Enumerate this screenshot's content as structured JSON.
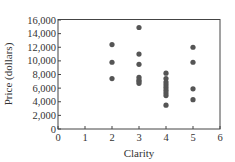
{
  "chart_data": {
    "type": "scatter",
    "title": "",
    "xlabel": "Clarity",
    "ylabel": "Price (dollars)",
    "xlim": [
      0,
      6
    ],
    "ylim": [
      0,
      16000
    ],
    "x_ticks": [
      0,
      1,
      2,
      3,
      4,
      5,
      6
    ],
    "x_tick_labels": [
      "0",
      "1",
      "2",
      "3",
      "4",
      "5",
      "6"
    ],
    "y_ticks": [
      0,
      2000,
      4000,
      6000,
      8000,
      10000,
      12000,
      14000,
      16000
    ],
    "y_tick_labels": [
      "0",
      "2,000",
      "4,000",
      "6,000",
      "8,000",
      "10,000",
      "12,000",
      "14,000",
      "16,000"
    ],
    "grid": false,
    "legend": null,
    "marker_color": "#555555",
    "series": [
      {
        "name": "Diamonds",
        "points": [
          {
            "x": 2,
            "y": 12400
          },
          {
            "x": 2,
            "y": 9800
          },
          {
            "x": 2,
            "y": 7400
          },
          {
            "x": 3,
            "y": 14900
          },
          {
            "x": 3,
            "y": 11000
          },
          {
            "x": 3,
            "y": 9500
          },
          {
            "x": 3,
            "y": 7600
          },
          {
            "x": 3,
            "y": 7200
          },
          {
            "x": 3,
            "y": 7000
          },
          {
            "x": 3,
            "y": 6700
          },
          {
            "x": 4,
            "y": 8200
          },
          {
            "x": 4,
            "y": 7400
          },
          {
            "x": 4,
            "y": 6900
          },
          {
            "x": 4,
            "y": 6500
          },
          {
            "x": 4,
            "y": 6100
          },
          {
            "x": 4,
            "y": 5700
          },
          {
            "x": 4,
            "y": 5300
          },
          {
            "x": 4,
            "y": 4900
          },
          {
            "x": 4,
            "y": 3500
          },
          {
            "x": 5,
            "y": 12000
          },
          {
            "x": 5,
            "y": 9800
          },
          {
            "x": 5,
            "y": 5900
          },
          {
            "x": 5,
            "y": 4300
          }
        ]
      }
    ]
  }
}
